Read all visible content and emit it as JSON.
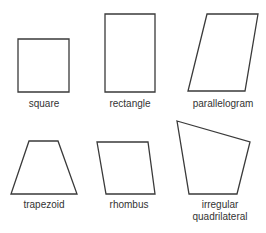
{
  "diagram": {
    "shapes": [
      {
        "name": "square",
        "label": [
          "square"
        ],
        "points": "18,39 69,39 69,92 18,92",
        "label_x": 44,
        "label_y": [
          107
        ]
      },
      {
        "name": "rectangle",
        "label": [
          "rectangle"
        ],
        "points": "105,14 155,14 155,92 105,92",
        "label_x": 130,
        "label_y": [
          107
        ]
      },
      {
        "name": "parallelogram",
        "label": [
          "parallelogram"
        ],
        "points": "207,14 258,14 245,91 188,91",
        "label_x": 223,
        "label_y": [
          107
        ]
      },
      {
        "name": "trapezoid",
        "label": [
          "trapezoid"
        ],
        "points": "29,141 58,141 77,194 11,194",
        "label_x": 44,
        "label_y": [
          208
        ]
      },
      {
        "name": "rhombus",
        "label": [
          "rhombus"
        ],
        "points": "97,142 148,142 155,194 106,194",
        "label_x": 129,
        "label_y": [
          208
        ]
      },
      {
        "name": "irregular-quadrilateral",
        "label": [
          "irregular",
          "quadrilateral"
        ],
        "points": "177,121 250,142 237,194 189,194",
        "label_x": 220,
        "label_y": [
          208,
          220
        ]
      }
    ],
    "stroke_color": "#3a3a3a",
    "label_color": "#333333"
  }
}
